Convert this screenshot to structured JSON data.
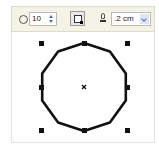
{
  "property_bar": {
    "polygon_sides": {
      "icon": "polygon-sides-icon",
      "value": "10"
    },
    "star_toggle": {
      "icon": "star-sharp-polygon-icon",
      "active": true
    },
    "outline_width": {
      "icon": "outline-pen-icon",
      "value": ".2 cm"
    }
  },
  "canvas": {
    "shape": "polygon",
    "sides": 10,
    "center": [
      84,
      87
    ],
    "radius": 44,
    "stroke": "#111111",
    "selection_handles": 8,
    "center_marker": "x"
  },
  "colors": {
    "toolbar_bg": "#f4f3e6",
    "spinner_accent": "#4a72b0"
  }
}
